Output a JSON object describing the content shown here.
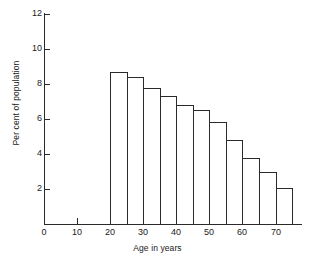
{
  "chart_data": {
    "type": "bar",
    "title": "",
    "subtitle": "",
    "xlabel": "Age in years",
    "ylabel": "Per cent of population",
    "xlim": [
      0,
      78
    ],
    "ylim": [
      0,
      12
    ],
    "grid": false,
    "legend": null,
    "bin_width": 5,
    "x_ticks": [
      0,
      10,
      20,
      30,
      40,
      50,
      60,
      70
    ],
    "x_tick_labels": [
      "0",
      "10",
      "20",
      "30",
      "40",
      "50",
      "60",
      "70"
    ],
    "x_minor_ticks": [
      25,
      35,
      45,
      55,
      65,
      75
    ],
    "y_ticks": [
      2,
      4,
      6,
      8,
      10,
      12
    ],
    "y_tick_labels": [
      "2",
      "4",
      "6",
      "8",
      "10",
      "12"
    ],
    "bins": [
      {
        "label": "20-25",
        "x0": 20,
        "x1": 25,
        "value": 8.7
      },
      {
        "label": "25-30",
        "x0": 25,
        "x1": 30,
        "value": 8.4
      },
      {
        "label": "30-35",
        "x0": 30,
        "x1": 35,
        "value": 7.75
      },
      {
        "label": "35-40",
        "x0": 35,
        "x1": 40,
        "value": 7.3
      },
      {
        "label": "40-45",
        "x0": 40,
        "x1": 45,
        "value": 6.8
      },
      {
        "label": "45-50",
        "x0": 45,
        "x1": 50,
        "value": 6.5
      },
      {
        "label": "50-55",
        "x0": 50,
        "x1": 55,
        "value": 5.85
      },
      {
        "label": "55-60",
        "x0": 55,
        "x1": 60,
        "value": 4.8
      },
      {
        "label": "60-65",
        "x0": 60,
        "x1": 65,
        "value": 3.75
      },
      {
        "label": "65-70",
        "x0": 65,
        "x1": 70,
        "value": 3.0
      },
      {
        "label": "70-75",
        "x0": 70,
        "x1": 75,
        "value": 2.05
      }
    ],
    "categories": [
      "20-25",
      "25-30",
      "30-35",
      "35-40",
      "40-45",
      "45-50",
      "50-55",
      "55-60",
      "60-65",
      "65-70",
      "70-75"
    ],
    "values": [
      8.7,
      8.4,
      7.75,
      7.3,
      6.8,
      6.5,
      5.85,
      4.8,
      3.75,
      3.0,
      2.05
    ],
    "colors": {
      "bar_stroke": "#2a2a2a",
      "bar_fill": "transparent",
      "axis": "#2a2a2a",
      "text": "#1a1a1a",
      "background": "#ffffff"
    }
  }
}
